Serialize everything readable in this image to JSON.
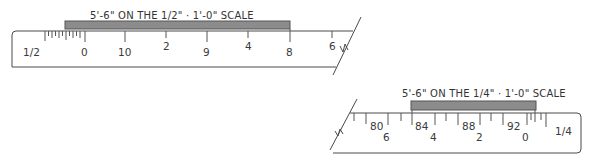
{
  "diagram": {
    "type": "architectural-scale-ruler-illustration",
    "colors": {
      "bar_fill": "#8c8c8c",
      "line": "#4a4a4a",
      "text": "#333333",
      "background": "#ffffff"
    },
    "rulers": [
      {
        "id": "half-inch",
        "caption": "5'-6\" ON THE 1/2\" · 1'-0\" SCALE",
        "scale_label": "1/2",
        "zero_label": "0",
        "labels": [
          "10",
          "2",
          "9",
          "4",
          "8",
          "6"
        ],
        "measure_bar": {
          "length": "5'-6\""
        }
      },
      {
        "id": "quarter-inch",
        "caption": "5'-6\" ON THE 1/4\" · 1'-0\" SCALE",
        "scale_label": "1/4",
        "upper_labels": [
          "80",
          "84",
          "88",
          "92"
        ],
        "lower_labels": [
          "6",
          "4",
          "2",
          "0"
        ],
        "measure_bar": {
          "length": "5'-6\""
        }
      }
    ]
  }
}
